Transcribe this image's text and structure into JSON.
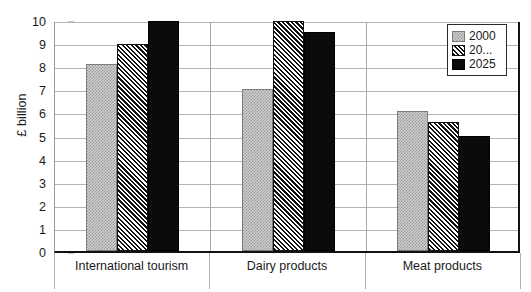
{
  "chart_data": {
    "type": "bar",
    "title": "",
    "xlabel": "",
    "ylabel": "£ billion",
    "ylim": [
      0,
      10
    ],
    "yticks": [
      0,
      1,
      2,
      3,
      4,
      5,
      6,
      7,
      8,
      9,
      10
    ],
    "ytick_labels": [
      "0",
      "1",
      "2",
      "3",
      "4",
      "5",
      "6",
      "7",
      "8",
      "9",
      "10"
    ],
    "grid": true,
    "legend_position": "top-right",
    "categories": [
      "International tourism",
      "Dairy products",
      "Meat products"
    ],
    "series": [
      {
        "name": "2000",
        "values": [
          8.1,
          7.0,
          6.05
        ],
        "fill": "stipple-gray",
        "color": "#cfcfcf"
      },
      {
        "name": "20...",
        "values": [
          8.95,
          9.95,
          5.6
        ],
        "fill": "diagonal-hatch",
        "color": "#1a1a1a"
      },
      {
        "name": "2025",
        "values": [
          9.95,
          9.5,
          5.0
        ],
        "fill": "solid-black",
        "color": "#0b0b0b"
      }
    ]
  },
  "legend": {
    "items": [
      {
        "label": "2000"
      },
      {
        "label": "20..."
      },
      {
        "label": "2025"
      }
    ]
  },
  "axes": {
    "y_title": "£ billion"
  },
  "colors": {
    "frame": "#111111",
    "gridline": "#b4b4b4",
    "axis": "#9a9a9a",
    "text": "#1a1a1a"
  }
}
